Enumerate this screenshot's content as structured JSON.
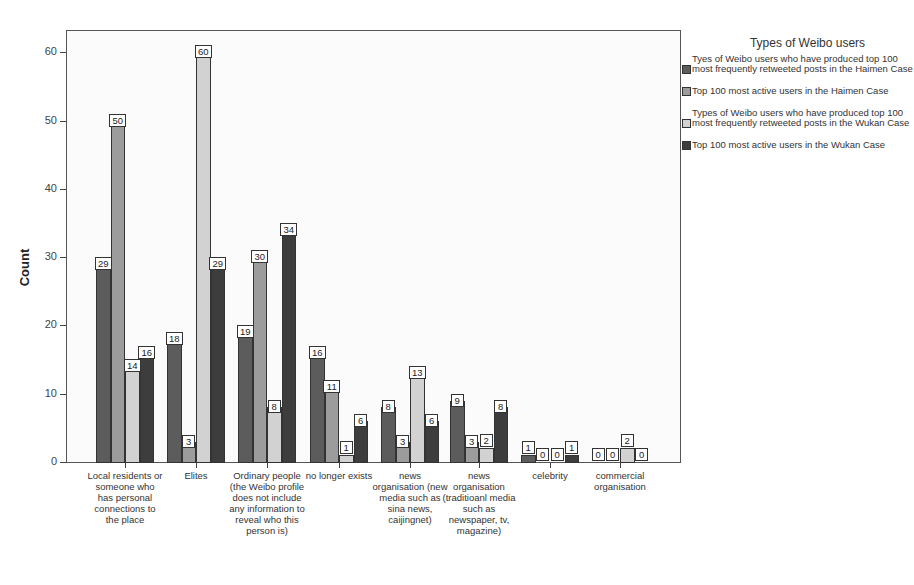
{
  "chart_data": {
    "type": "bar",
    "title": "",
    "xlabel": "",
    "ylabel": "Count",
    "ylim": [
      0,
      63
    ],
    "yticks": [
      0,
      10,
      20,
      30,
      40,
      50,
      60
    ],
    "grid": false,
    "legend_position": "right",
    "legend_title": "Types of Weibo users",
    "categories": [
      "Local residents or someone who has personal connections to the place",
      "Elites",
      "Ordinary people (the Weibo profile does not include any information to reveal who this person is)",
      "no longer exists",
      "news organisation (new media such as sina news, caijingnet)",
      "news organisation (traditioanl media such as newspaper, tv, magazine)",
      "celebrity",
      "commercial organisation"
    ],
    "series": [
      {
        "name": "Tyes of Weibo users who have produced top 100 most frequently retweeted posts in the Haimen Case",
        "color": "#5c5c5c",
        "values": [
          29,
          18,
          19,
          16,
          8,
          9,
          1,
          0
        ]
      },
      {
        "name": "Top 100 most active users in the Haimen Case",
        "color": "#9c9c9c",
        "values": [
          50,
          3,
          30,
          11,
          3,
          3,
          0,
          0
        ]
      },
      {
        "name": "Types of Weibo users who have produced top 100 most frequently retweeted posts in the Wukan Case",
        "color": "#d2d2d2",
        "values": [
          14,
          60,
          8,
          1,
          13,
          2,
          0,
          2
        ]
      },
      {
        "name": "Top 100 most active users in the Wukan Case",
        "color": "#3d3d3d",
        "values": [
          16,
          29,
          34,
          6,
          6,
          8,
          1,
          0
        ]
      }
    ]
  },
  "axis": {
    "ylabel": "Count",
    "yticks": [
      "0",
      "10",
      "20",
      "30",
      "40",
      "50",
      "60"
    ]
  },
  "legend": {
    "title": "Types of Weibo users",
    "items": [
      "Tyes of Weibo users who have produced top 100 most frequently retweeted posts in the Haimen Case",
      "Top 100 most active users in the Haimen Case",
      "Types of Weibo users who have produced top 100 most frequently retweeted posts in the Wukan Case",
      "Top 100 most active users in the Wukan Case"
    ]
  }
}
